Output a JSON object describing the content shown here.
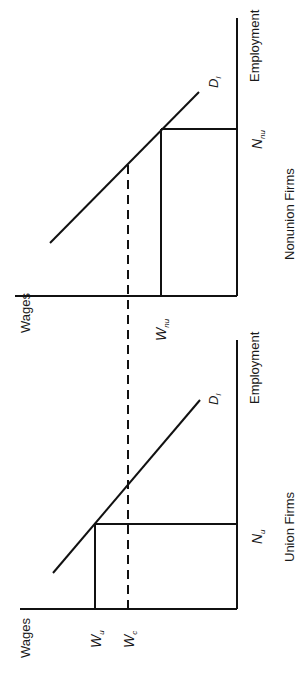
{
  "diagram": {
    "panels": [
      {
        "id": "nonunion",
        "caption": "Nonunion Firms",
        "y_axis_label": "Wages",
        "x_axis_label": "Employment",
        "demand_label": "D",
        "demand_subscript": "l",
        "wage_label": "W",
        "wage_subscript": "nu",
        "employment_label": "N",
        "employment_subscript": "nu"
      },
      {
        "id": "union",
        "caption": "Union Firms",
        "y_axis_label": "Wages",
        "x_axis_label": "Employment",
        "demand_label": "D",
        "demand_subscript": "l",
        "wage_label": "W",
        "wage_subscript": "u",
        "competitive_wage_label": "W",
        "competitive_wage_subscript": "c",
        "employment_label": "N",
        "employment_subscript": "u"
      }
    ],
    "shared": {
      "dashed_line": "competitive wage W_c spanning both panels"
    }
  }
}
